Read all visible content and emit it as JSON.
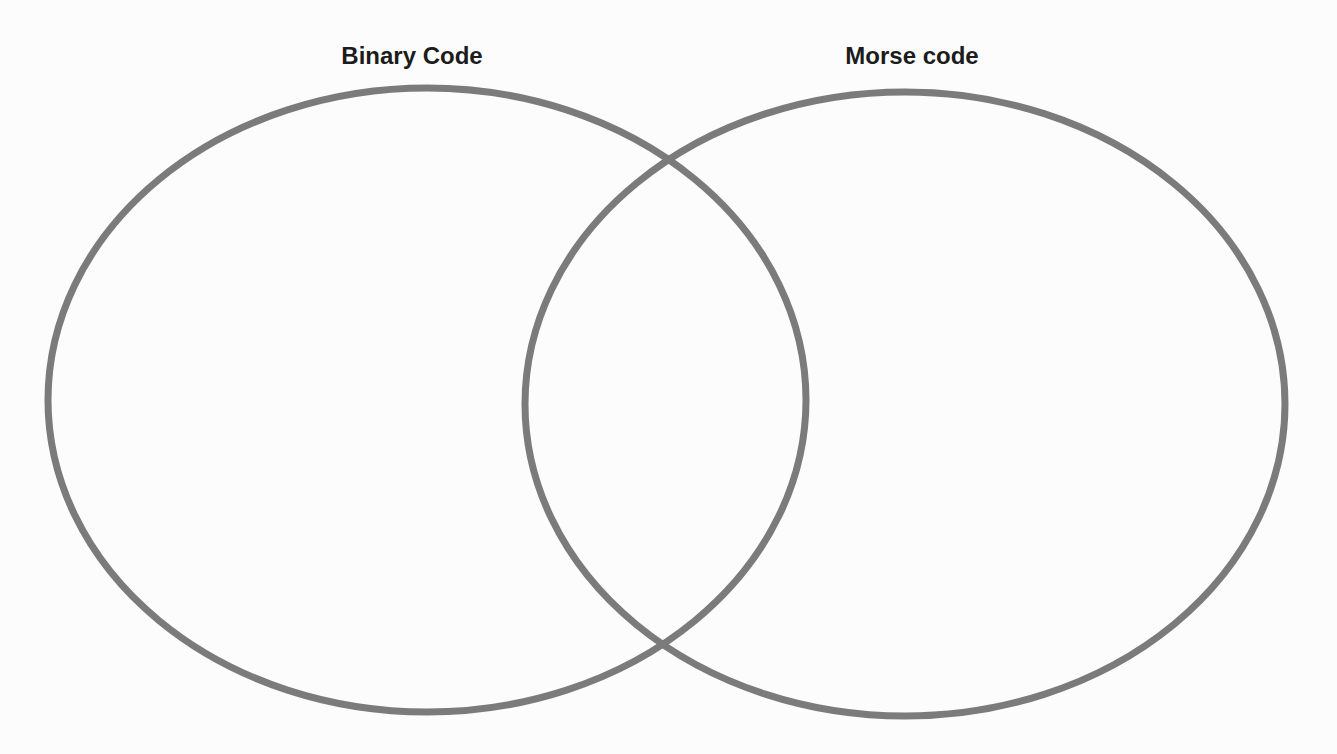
{
  "diagram": {
    "type": "venn",
    "stroke_color": "#7b7b7b",
    "background_color": "#fcfcfc",
    "sets": [
      {
        "label": "Binary Code",
        "cx": 427,
        "cy": 400,
        "rx": 379,
        "ry": 312,
        "label_x": 412
      },
      {
        "label": "Morse code",
        "cx": 905,
        "cy": 404,
        "rx": 380,
        "ry": 312,
        "label_x": 912
      }
    ],
    "regions": {
      "binary_only": [],
      "both": [],
      "morse_only": []
    }
  }
}
